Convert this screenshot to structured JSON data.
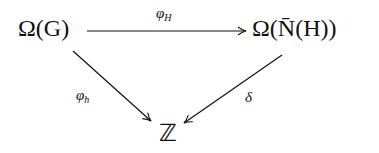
{
  "diagram": {
    "type": "commutative-triangle",
    "nodes": {
      "top_left": {
        "text": "Ω(G)"
      },
      "top_right": {
        "text": "Ω(N̄(H))"
      },
      "bottom": {
        "text": "ℤ"
      }
    },
    "arrows": [
      {
        "from": "top_left",
        "to": "top_right",
        "label_base": "φ",
        "label_sub": "H"
      },
      {
        "from": "top_left",
        "to": "bottom",
        "label_base": "φ",
        "label_sub": "h"
      },
      {
        "from": "top_right",
        "to": "bottom",
        "label_base": "δ",
        "label_sub": ""
      }
    ],
    "colors": {
      "ink": "#111111",
      "background": "#ffffff"
    }
  }
}
